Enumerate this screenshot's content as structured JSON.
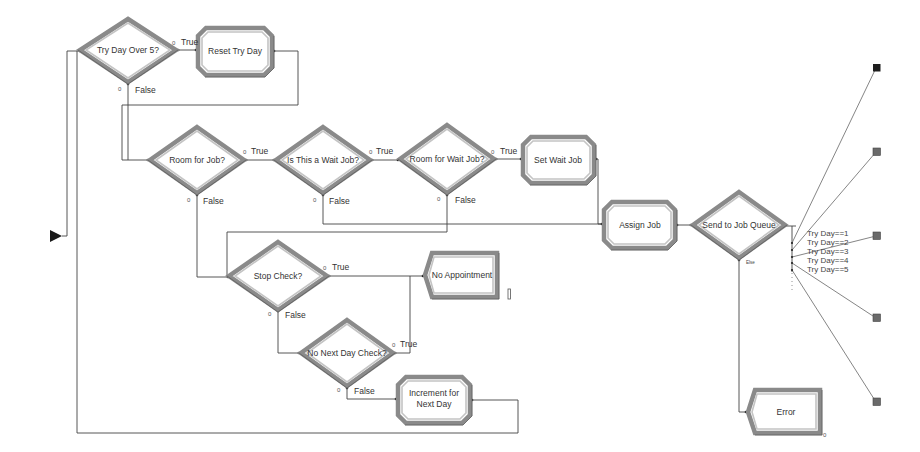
{
  "diagram": {
    "decisions": {
      "try_day_over_5": "Try Day Over 5?",
      "room_for_job": "Room for Job?",
      "is_wait_job": "Is This a Wait Job?",
      "room_for_wait_job": "Room for Wait Job?",
      "stop_check": "Stop Check?",
      "no_next_day_check": "No Next Day Check?",
      "send_to_job_queue": "Send to Job Queue"
    },
    "processes": {
      "reset_try_day": "Reset Try Day",
      "set_wait_job": "Set Wait Job",
      "assign_job": "Assign Job",
      "increment_line1": "Increment for",
      "increment_line2": "Next Day"
    },
    "terminators": {
      "no_appointment": "No Appointment",
      "error": "Error"
    },
    "branch": {
      "true": "True",
      "false": "False",
      "else": "Else",
      "port": "0"
    },
    "queue_conditions": [
      "Try Day==1",
      "Try Day==2",
      "Try Day==3",
      "Try Day==4",
      "Try Day==5"
    ],
    "colors": {
      "shape_border": "#8a8a8a",
      "connector": "#444444",
      "exit_first": "#1e1e1e",
      "exit_other": "#6a6a6a"
    }
  }
}
